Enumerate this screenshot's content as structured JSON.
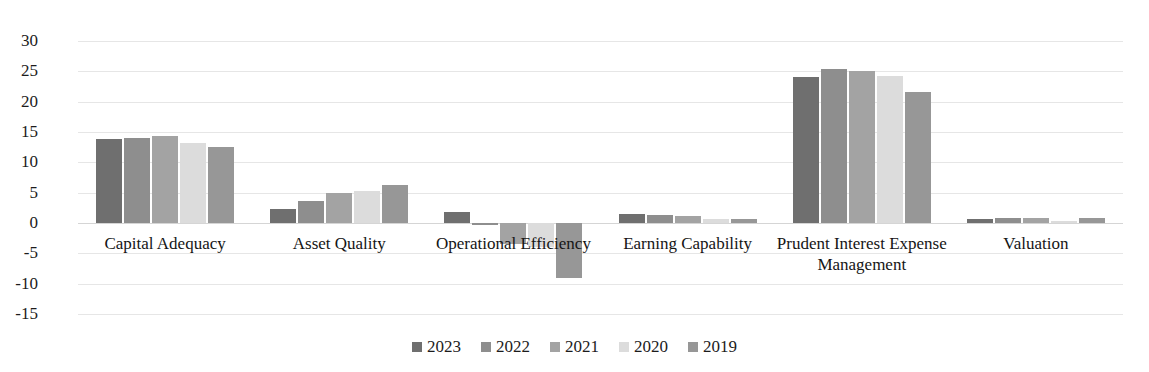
{
  "chart_data": {
    "type": "bar",
    "title": "",
    "xlabel": "",
    "ylabel": "",
    "ylim": [
      -15,
      30
    ],
    "yticks": [
      30,
      25,
      20,
      15,
      10,
      5,
      0,
      -5,
      -10,
      -15
    ],
    "ytick_labels": [
      "30",
      "25",
      "20",
      "15",
      "10",
      "5",
      "0",
      "-5",
      "-10",
      "-15"
    ],
    "grid": true,
    "legend_position": "bottom",
    "categories": [
      "Capital Adequacy",
      "Asset Quality",
      "Operational Efficiency",
      "Earning Capability",
      "Prudent Interest Expense Management",
      "Valuation"
    ],
    "series": [
      {
        "name": "2023",
        "color": "#6f6f6f",
        "values": [
          13.8,
          2.3,
          1.8,
          1.5,
          24.0,
          0.7
        ]
      },
      {
        "name": "2022",
        "color": "#8e8e8e",
        "values": [
          14.0,
          3.7,
          -0.4,
          1.4,
          25.4,
          0.8
        ]
      },
      {
        "name": "2021",
        "color": "#a3a3a3",
        "values": [
          14.3,
          5.0,
          -3.5,
          1.2,
          25.0,
          0.9
        ]
      },
      {
        "name": "2020",
        "color": "#dcdcdc",
        "values": [
          13.2,
          5.2,
          -4.0,
          0.7,
          24.3,
          0.4
        ]
      },
      {
        "name": "2019",
        "color": "#979797",
        "values": [
          12.5,
          6.3,
          -9.0,
          0.6,
          21.6,
          0.8
        ]
      }
    ]
  },
  "legend": {
    "items": [
      {
        "label": "2023"
      },
      {
        "label": "2022"
      },
      {
        "label": "2021"
      },
      {
        "label": "2020"
      },
      {
        "label": "2019"
      }
    ]
  }
}
